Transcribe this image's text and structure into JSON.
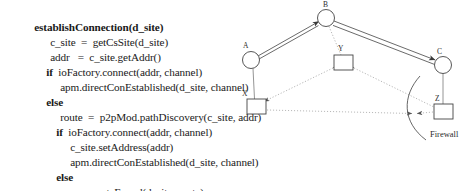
{
  "pseudocode": {
    "lines": [
      {
        "text": "establishConnection(d_site)",
        "indent": 0,
        "bold_prefix": "establishConnection",
        "style": "head"
      },
      {
        "text": "c_site  =  getCsSite(d_site)",
        "indent": 1,
        "style": "plain"
      },
      {
        "text": "addr   =  c_site.getAddr()",
        "indent": 1,
        "style": "plain"
      },
      {
        "text": "ioFactory.connect(addr, channel)",
        "indent": 1,
        "style": "kw",
        "keyword": "if"
      },
      {
        "text": "apm.directConEstablished(d_site, channel)",
        "indent": 2,
        "style": "plain"
      },
      {
        "text": "else",
        "indent": 1,
        "style": "kwonly"
      },
      {
        "text": "route  =  p2pMod.pathDiscovery(c_site, addr)",
        "indent": 2,
        "style": "plain"
      },
      {
        "text": "ioFactory.connect(addr, channel)",
        "indent": 2,
        "style": "kw",
        "keyword": "if"
      },
      {
        "text": "c_site.setAddress(addr)",
        "indent": 3,
        "style": "plain"
      },
      {
        "text": "apm.directConEstablished(d_site, channel)",
        "indent": 3,
        "style": "plain"
      },
      {
        "text": "else",
        "indent": 2,
        "style": "kwonly"
      },
      {
        "text": "apm.routeFound(d_site, route)",
        "indent": 3,
        "style": "plain"
      }
    ]
  },
  "diagram": {
    "type": "network-topology",
    "nodes": [
      {
        "id": "A",
        "label": "A",
        "shape": "circle",
        "cx": 17,
        "cy": 60,
        "r": 8.5
      },
      {
        "id": "B",
        "label": "B",
        "shape": "circle",
        "cx": 92,
        "cy": 18,
        "r": 8.5
      },
      {
        "id": "C",
        "label": "C",
        "shape": "circle",
        "cx": 209,
        "cy": 65,
        "r": 8.5
      },
      {
        "id": "X",
        "label": "X",
        "shape": "square",
        "x": 13,
        "y": 99,
        "w": 19,
        "h": 15
      },
      {
        "id": "Y",
        "label": "Y",
        "shape": "square",
        "x": 100,
        "y": 55,
        "w": 19,
        "h": 15
      },
      {
        "id": "Z",
        "label": "Z",
        "shape": "square",
        "x": 200,
        "y": 104,
        "w": 19,
        "h": 15
      }
    ],
    "edges": [
      {
        "from": "A",
        "to": "B",
        "style": "double-solid",
        "arrows": "both"
      },
      {
        "from": "B",
        "to": "C",
        "style": "double-solid",
        "arrows": "both"
      },
      {
        "from": "A",
        "to": "X",
        "style": "solid",
        "arrows": "none"
      },
      {
        "from": "C",
        "to": "Z",
        "style": "solid",
        "arrows": "none"
      },
      {
        "from": "B",
        "to": "Y",
        "style": "dotted",
        "arrows": "none"
      },
      {
        "from": "Y",
        "to": "X",
        "style": "dotted",
        "arrows": "both"
      },
      {
        "from": "Y",
        "to": "Z",
        "style": "dotted",
        "arrows": "both"
      },
      {
        "from": "X",
        "to": "firewall",
        "style": "dotted",
        "arrows": "end"
      },
      {
        "from": "Z",
        "to": "firewall",
        "style": "dotted",
        "arrows": "end"
      }
    ],
    "firewall": {
      "label": "Firewall",
      "label_x": 196,
      "label_y": 137
    }
  }
}
